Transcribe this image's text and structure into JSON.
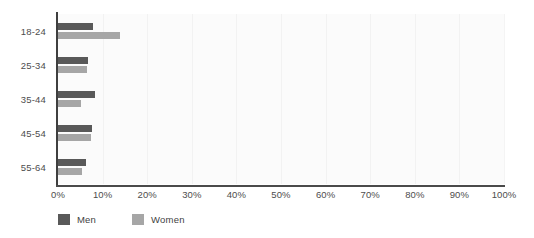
{
  "chart_data": {
    "type": "bar",
    "orientation": "horizontal",
    "title": "",
    "xlabel": "",
    "ylabel": "",
    "categories": [
      "18-24",
      "25-34",
      "35-44",
      "45-54",
      "55-64"
    ],
    "series": [
      {
        "name": "Men",
        "color": "#595959",
        "values": [
          7.8,
          6.7,
          8.3,
          7.6,
          6.3
        ]
      },
      {
        "name": "Women",
        "color": "#a6a6a6",
        "values": [
          13.9,
          6.5,
          5.2,
          7.4,
          5.4
        ]
      }
    ],
    "xlim": [
      0,
      100
    ],
    "xticks": [
      0,
      10,
      20,
      30,
      40,
      50,
      60,
      70,
      80,
      90,
      100
    ],
    "xtick_labels": [
      "0%",
      "10%",
      "20%",
      "30%",
      "40%",
      "50%",
      "60%",
      "70%",
      "80%",
      "90%",
      "100%"
    ],
    "grid": true,
    "grid_axis": "x",
    "legend_position": "bottom-left",
    "value_suffix": "%"
  },
  "legend": {
    "items": [
      {
        "label": "Men",
        "color": "#595959"
      },
      {
        "label": "Women",
        "color": "#a6a6a6"
      }
    ]
  },
  "colors": {
    "men": "#595959",
    "women": "#a6a6a6",
    "plot_background": "#fbfbfb",
    "gridline": "#f2f2f2",
    "axis": "#4a4a4a",
    "text": "#4d4d4d"
  }
}
